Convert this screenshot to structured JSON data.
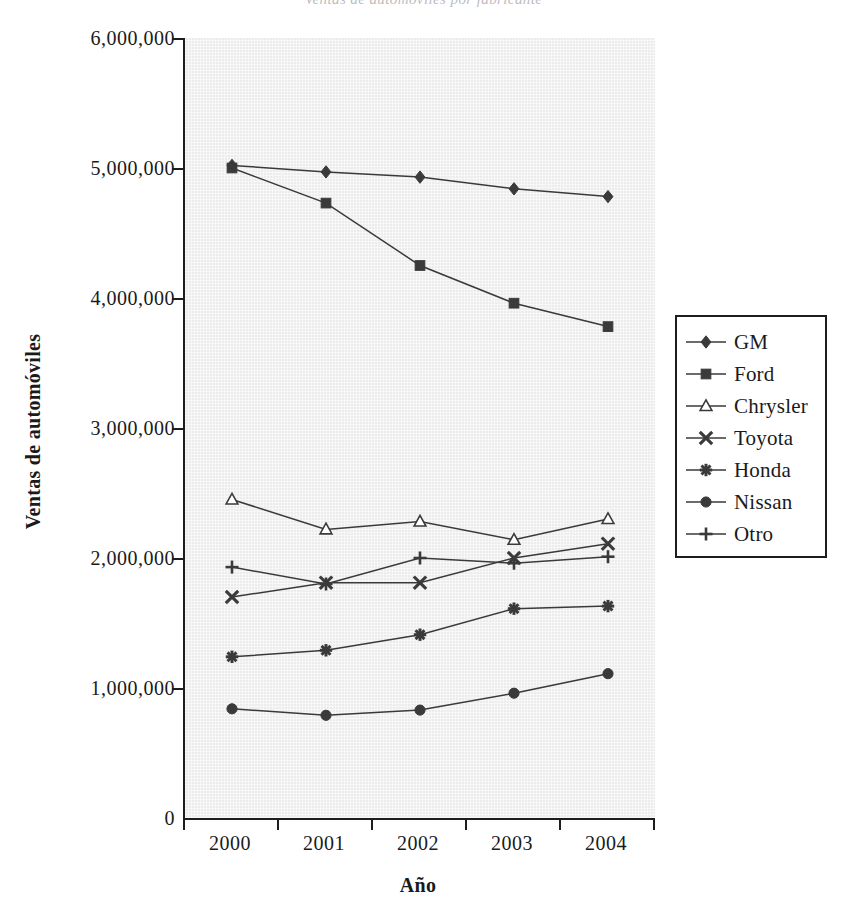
{
  "title_clipped": "Ventas de automóviles por fabricante",
  "axes": {
    "ylabel": "Ventas de automóviles",
    "xlabel": "Año",
    "yticks": [
      "0",
      "1,000,000",
      "2,000,000",
      "3,000,000",
      "4,000,000",
      "5,000,000",
      "6,000,000"
    ],
    "xticks": [
      "2000",
      "2001",
      "2002",
      "2003",
      "2004"
    ]
  },
  "colors": {
    "plot_background": "#ececec",
    "axis": "#1d1d1d",
    "series": "#3a3a3a",
    "legend_background": "#ffffff"
  },
  "legend": {
    "position": "right",
    "entries": [
      {
        "label": "GM",
        "marker": "diamond-filled-icon"
      },
      {
        "label": "Ford",
        "marker": "square-filled-icon"
      },
      {
        "label": "Chrysler",
        "marker": "triangle-open-icon"
      },
      {
        "label": "Toyota",
        "marker": "cross-x-icon"
      },
      {
        "label": "Honda",
        "marker": "asterisk-filled-icon"
      },
      {
        "label": "Nissan",
        "marker": "circle-filled-icon"
      },
      {
        "label": "Otro",
        "marker": "plus-icon"
      }
    ]
  },
  "chart_data": {
    "type": "line",
    "title": "Ventas de automóviles por fabricante",
    "xlabel": "Año",
    "ylabel": "Ventas de automóviles",
    "categories": [
      "2000",
      "2001",
      "2002",
      "2003",
      "2004"
    ],
    "ylim": [
      0,
      6000000
    ],
    "ytick_step": 1000000,
    "grid": false,
    "legend_position": "right",
    "series": [
      {
        "name": "GM",
        "marker": "diamond-filled-icon",
        "values": [
          5020000,
          4970000,
          4930000,
          4840000,
          4780000
        ]
      },
      {
        "name": "Ford",
        "marker": "square-filled-icon",
        "values": [
          5000000,
          4730000,
          4250000,
          3960000,
          3780000
        ]
      },
      {
        "name": "Chrysler",
        "marker": "triangle-open-icon",
        "values": [
          2450000,
          2220000,
          2280000,
          2140000,
          2300000
        ]
      },
      {
        "name": "Toyota",
        "marker": "cross-x-icon",
        "values": [
          1700000,
          1810000,
          1810000,
          2000000,
          2110000
        ]
      },
      {
        "name": "Honda",
        "marker": "asterisk-filled-icon",
        "values": [
          1240000,
          1290000,
          1410000,
          1610000,
          1630000
        ]
      },
      {
        "name": "Nissan",
        "marker": "circle-filled-icon",
        "values": [
          840000,
          790000,
          830000,
          960000,
          1110000
        ]
      },
      {
        "name": "Otro",
        "marker": "plus-icon",
        "values": [
          1930000,
          1800000,
          2000000,
          1960000,
          2010000
        ]
      }
    ]
  }
}
